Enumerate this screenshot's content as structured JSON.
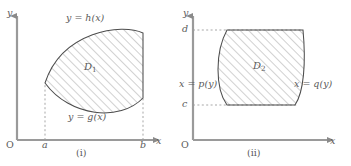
{
  "figure": {
    "width": 351,
    "height": 166,
    "background": "#ffffff",
    "ink_color": "#5a5a5a",
    "hatch_color": "#8c8c8c",
    "outline_color": "#4d4d4d"
  },
  "panels": [
    {
      "id": "i",
      "caption": "(i)",
      "axes": {
        "x_label": "x",
        "y_label": "y",
        "origin_label": "O"
      },
      "ticks": [
        {
          "name": "a",
          "label": "a",
          "axis": "x"
        },
        {
          "name": "b",
          "label": "b",
          "axis": "x"
        }
      ],
      "region": {
        "label": "D",
        "subscript": "1"
      },
      "curves": [
        {
          "name": "upper-boundary",
          "label": "y = h(x)"
        },
        {
          "name": "lower-boundary",
          "label": "y = g(x)"
        }
      ]
    },
    {
      "id": "ii",
      "caption": "(ii)",
      "axes": {
        "x_label": "x",
        "y_label": "y",
        "origin_label": "O"
      },
      "ticks": [
        {
          "name": "c",
          "label": "c",
          "axis": "y"
        },
        {
          "name": "d",
          "label": "d",
          "axis": "y"
        }
      ],
      "region": {
        "label": "D",
        "subscript": "2"
      },
      "curves": [
        {
          "name": "left-boundary",
          "label": "x = p(y)"
        },
        {
          "name": "right-boundary",
          "label": "x = q(y)"
        }
      ]
    }
  ]
}
